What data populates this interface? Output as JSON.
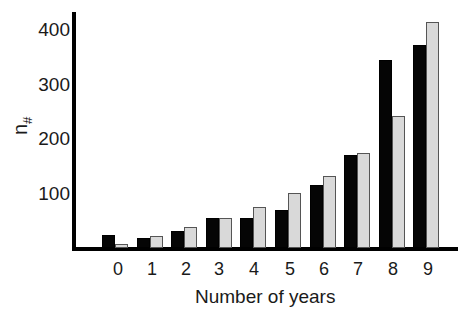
{
  "chart_data": {
    "type": "bar",
    "title": "",
    "xlabel": "Number of years",
    "ylabel": "n#",
    "ylabel_main": "n",
    "ylabel_sub": "#",
    "categories": [
      "0",
      "1",
      "2",
      "3",
      "4",
      "5",
      "6",
      "7",
      "8",
      "9"
    ],
    "series": [
      {
        "name": "Series 1 (black)",
        "color": "#050505",
        "values": [
          24,
          18,
          31,
          55,
          55,
          70,
          116,
          171,
          345,
          372
        ]
      },
      {
        "name": "Series 2 (gray)",
        "color": "#d9d9d9",
        "values": [
          7,
          22,
          38,
          55,
          75,
          101,
          132,
          174,
          242,
          415
        ]
      }
    ],
    "yticks": [
      "100",
      "200",
      "300",
      "400"
    ],
    "ylim": [
      0,
      430
    ],
    "grid": false,
    "legend": "none"
  }
}
